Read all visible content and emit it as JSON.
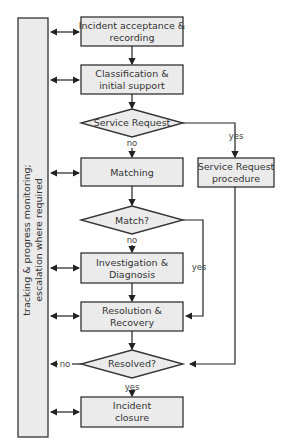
{
  "diagram": {
    "sidebar": {
      "line1": "tracking & progress monitoring;",
      "line2": "escalation where required"
    },
    "nodes": {
      "acceptance": {
        "line1": "Incident acceptance &",
        "line2": "recording"
      },
      "classification": {
        "line1": "Classification &",
        "line2": "initial support"
      },
      "service_request_decision": {
        "label": "Service Request"
      },
      "matching": {
        "label": "Matching"
      },
      "match_decision": {
        "label": "Match?"
      },
      "investigation": {
        "line1": "Investigation &",
        "line2": "Diagnosis"
      },
      "resolution": {
        "line1": "Resolution &",
        "line2": "Recovery"
      },
      "resolved_decision": {
        "label": "Resolved?"
      },
      "closure": {
        "line1": "Incident",
        "line2": "closure"
      },
      "sr_procedure": {
        "line1": "Service Request",
        "line2": "procedure"
      }
    },
    "edge_labels": {
      "sr_yes": "yes",
      "sr_no": "no",
      "match_yes": "yes",
      "match_no": "no",
      "resolved_no": "no",
      "resolved_yes": "yes"
    },
    "colors": {
      "fill": "#ebebeb",
      "stroke": "#333333"
    }
  }
}
